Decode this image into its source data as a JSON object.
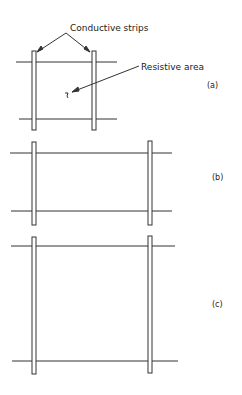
{
  "diagram": {
    "annotations": {
      "conductive_strips": "Conductive strips",
      "resistive_area": "Resistive area"
    },
    "panels": [
      {
        "id": "a",
        "label": "(a)",
        "strip_top": 51,
        "strip_bottom": 130,
        "left_strip_x": 32,
        "right_strip_x": 92,
        "line_top_y": 62,
        "line_bottom_y": 119,
        "line_left_x": 16,
        "line_right_x": 117
      },
      {
        "id": "b",
        "label": "(b)",
        "strip_top": 142,
        "strip_bottom": 225,
        "left_strip_x": 32,
        "right_strip_x": 148,
        "line_top_y": 153,
        "line_bottom_y": 211,
        "line_left_x": 10,
        "line_right_x": 172
      },
      {
        "id": "c",
        "label": "(c)",
        "strip_top": 237,
        "strip_bottom": 374,
        "left_strip_x": 32,
        "right_strip_x": 148,
        "line_top_y": 246,
        "line_bottom_y": 361,
        "line_left_x": 11,
        "line_right_x": 176
      }
    ],
    "colors": {
      "stroke": "#333333",
      "background": "#ffffff"
    }
  }
}
